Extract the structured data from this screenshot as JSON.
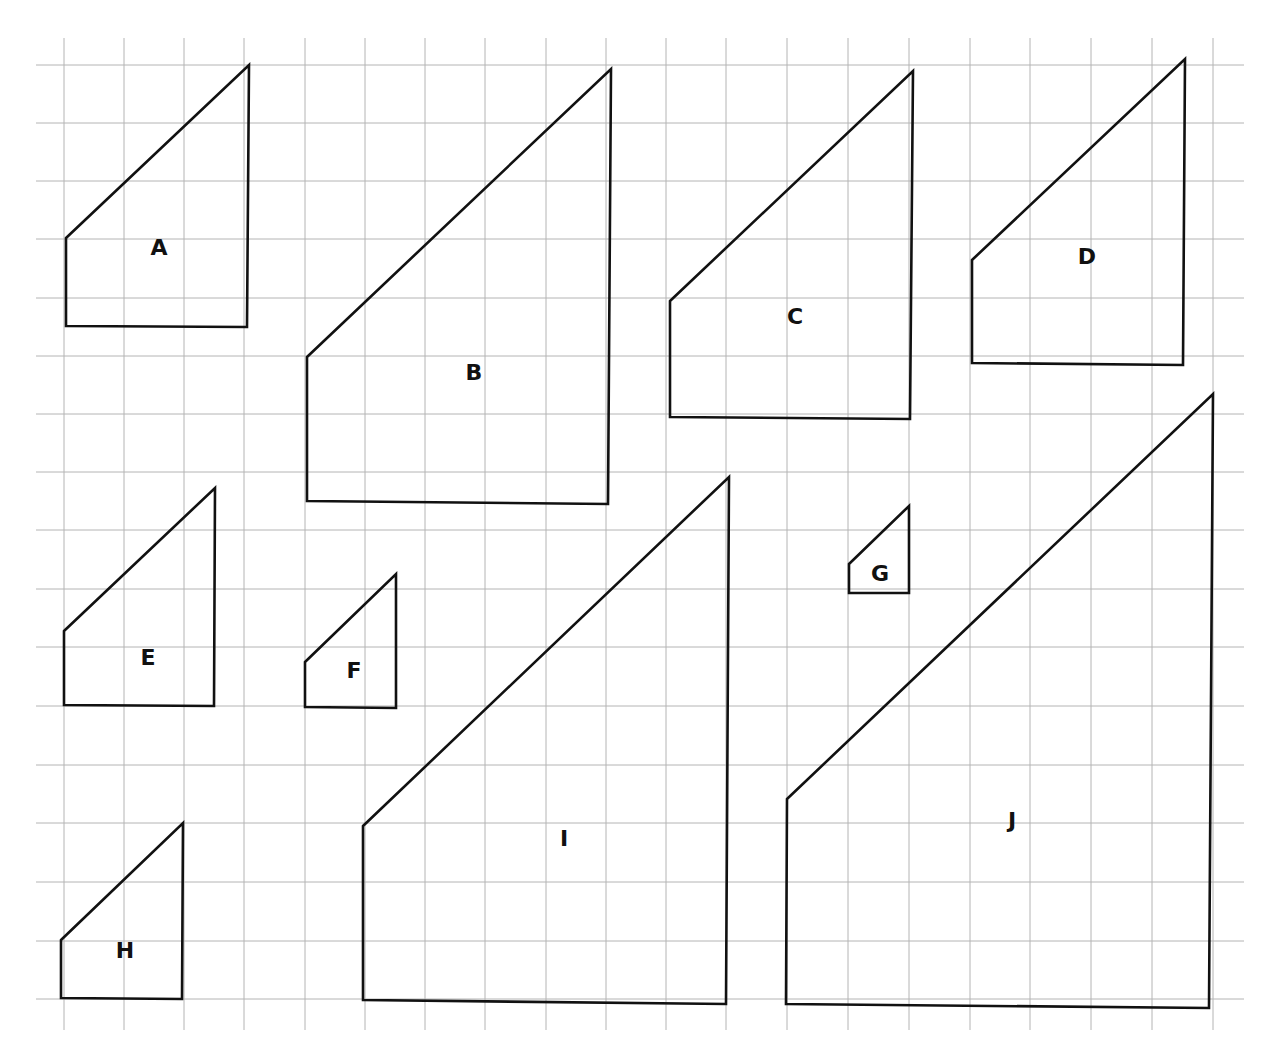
{
  "diagram": {
    "title": "",
    "grid": {
      "x_lines": [
        64,
        124,
        184,
        244,
        305,
        365,
        425,
        485,
        546,
        606,
        666,
        726,
        787,
        848,
        909,
        970,
        1030,
        1091,
        1152,
        1213
      ],
      "y_lines": [
        65,
        123,
        181,
        239,
        298,
        356,
        414,
        472,
        530,
        589,
        647,
        706,
        765,
        823,
        882,
        941,
        999
      ],
      "x_extent": [
        36,
        1244
      ],
      "y_extent": [
        38,
        1030
      ],
      "color": "#b4b4b4"
    },
    "shapes": [
      {
        "label": "A",
        "points": [
          [
            66,
            238
          ],
          [
            249,
            65
          ],
          [
            247,
            327
          ],
          [
            66,
            326
          ]
        ],
        "label_pos": [
          159,
          249
        ]
      },
      {
        "label": "B",
        "points": [
          [
            307,
            357
          ],
          [
            611,
            69
          ],
          [
            608,
            504
          ],
          [
            307,
            501
          ]
        ],
        "label_pos": [
          474,
          374
        ]
      },
      {
        "label": "C",
        "points": [
          [
            670,
            301
          ],
          [
            913,
            71
          ],
          [
            910,
            419
          ],
          [
            670,
            417
          ]
        ],
        "label_pos": [
          795,
          318
        ]
      },
      {
        "label": "D",
        "points": [
          [
            972,
            260
          ],
          [
            1185,
            59
          ],
          [
            1183,
            365
          ],
          [
            972,
            363
          ]
        ],
        "label_pos": [
          1087,
          258
        ]
      },
      {
        "label": "E",
        "points": [
          [
            64,
            631
          ],
          [
            215,
            488
          ],
          [
            214,
            706
          ],
          [
            64,
            705
          ]
        ],
        "label_pos": [
          148,
          659
        ]
      },
      {
        "label": "F",
        "points": [
          [
            305,
            662
          ],
          [
            396,
            574
          ],
          [
            396,
            708
          ],
          [
            305,
            707
          ]
        ],
        "label_pos": [
          354,
          672
        ]
      },
      {
        "label": "G",
        "points": [
          [
            849,
            564
          ],
          [
            909,
            506
          ],
          [
            909,
            593
          ],
          [
            849,
            593
          ]
        ],
        "label_pos": [
          880,
          575
        ]
      },
      {
        "label": "H",
        "points": [
          [
            61,
            940
          ],
          [
            183,
            823
          ],
          [
            182,
            999
          ],
          [
            61,
            998
          ]
        ],
        "label_pos": [
          125,
          952
        ]
      },
      {
        "label": "I",
        "points": [
          [
            363,
            826
          ],
          [
            729,
            477
          ],
          [
            726,
            1004
          ],
          [
            363,
            1000
          ]
        ],
        "label_pos": [
          564,
          840
        ]
      },
      {
        "label": "J",
        "points": [
          [
            787,
            799
          ],
          [
            1213,
            394
          ],
          [
            1209,
            1008
          ],
          [
            786,
            1004
          ]
        ],
        "label_pos": [
          1012,
          822
        ]
      }
    ],
    "colors": {
      "background": "#ffffff",
      "outline": "#111111",
      "label": "#111111"
    }
  }
}
